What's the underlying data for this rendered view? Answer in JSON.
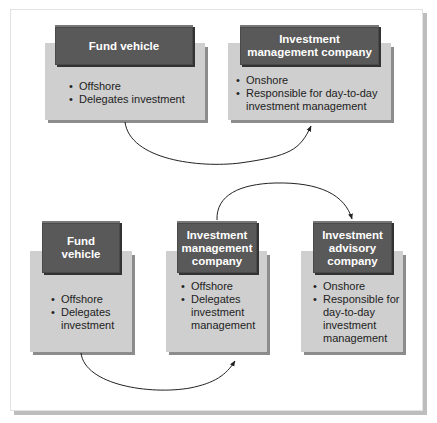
{
  "diagram": {
    "top_section": {
      "boxes": [
        {
          "title": "Fund vehicle",
          "bullets": [
            "Offshore",
            "Delegates investment"
          ]
        },
        {
          "title": "Investment management company",
          "bullets": [
            "Onshore",
            "Responsible for day-to-day investment management"
          ]
        }
      ],
      "arrows": [
        {
          "from": "Fund vehicle",
          "to": "Investment management company"
        }
      ]
    },
    "bottom_section": {
      "boxes": [
        {
          "title": "Fund vehicle",
          "bullets": [
            "Offshore",
            "Delegates investment"
          ]
        },
        {
          "title": "Investment management company",
          "bullets": [
            "Offshore",
            "Delegates investment management"
          ]
        },
        {
          "title": "Investment advisory company",
          "bullets": [
            "Onshore",
            "Responsible for day-to-day investment management"
          ]
        }
      ],
      "arrows": [
        {
          "from": "Fund vehicle",
          "to": "Investment management company"
        },
        {
          "from": "Investment management company",
          "to": "Investment advisory company"
        }
      ]
    },
    "colors": {
      "header_fill": "#595959",
      "body_fill": "#cfcfcf",
      "shadow": "#8c8c8c",
      "text_dark": "#222222",
      "text_light": "#ffffff"
    }
  }
}
